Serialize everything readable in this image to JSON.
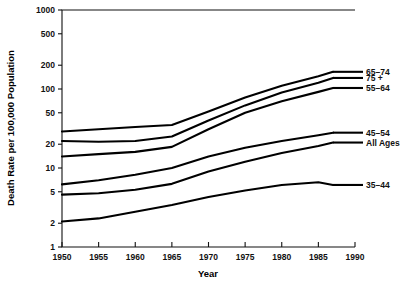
{
  "chart_data": {
    "type": "line",
    "title": "",
    "xlabel": "Year",
    "ylabel": "Death Rate per 100,000 Population",
    "xlim": [
      1950,
      1990
    ],
    "ylim": [
      1,
      1000
    ],
    "yscale": "log",
    "grid": false,
    "legend_position": "right-inline-labels",
    "xticks": [
      1950,
      1955,
      1960,
      1965,
      1970,
      1975,
      1980,
      1985,
      1990
    ],
    "xtick_labels": [
      "1950",
      "1955",
      "1960",
      "1965",
      "1970",
      "1975",
      "1980",
      "1985",
      "1990"
    ],
    "yticks": [
      1,
      2,
      5,
      10,
      20,
      50,
      100,
      200,
      500,
      1000
    ],
    "ytick_labels": [
      "1",
      "2",
      "5",
      "10",
      "20",
      "50",
      "100",
      "200",
      "500",
      "1000"
    ],
    "x": [
      1950,
      1955,
      1960,
      1965,
      1970,
      1975,
      1980,
      1985,
      1987
    ],
    "series": [
      {
        "name": "65-74",
        "label": "65–74",
        "values": [
          29,
          31,
          33,
          35,
          52,
          78,
          110,
          145,
          165
        ],
        "color": "#000000"
      },
      {
        "name": "75+",
        "label": "75 +",
        "values": [
          22,
          21.5,
          22,
          25,
          40,
          62,
          90,
          120,
          138
        ],
        "color": "#000000"
      },
      {
        "name": "55-64",
        "label": "55–64",
        "values": [
          14,
          15,
          16,
          18.5,
          31,
          50,
          70,
          92,
          103
        ],
        "color": "#000000"
      },
      {
        "name": "45-54",
        "label": "45–54",
        "values": [
          6.2,
          7,
          8.2,
          10,
          14,
          18,
          22,
          26,
          28
        ],
        "color": "#000000"
      },
      {
        "name": "All Ages",
        "label": "All  Ages",
        "values": [
          4.6,
          4.8,
          5.3,
          6.3,
          9,
          12,
          15.5,
          19,
          21
        ],
        "color": "#000000"
      },
      {
        "name": "35-44",
        "label": "35–44",
        "values": [
          2.1,
          2.3,
          2.8,
          3.4,
          4.3,
          5.2,
          6.1,
          6.6,
          6.1
        ],
        "color": "#000000"
      }
    ]
  },
  "axes": {
    "x_title": "Year",
    "y_title": "Death Rate per 100,000 Population"
  },
  "colors": {
    "line": "#000000",
    "axis": "#111111",
    "background": "#ffffff"
  }
}
